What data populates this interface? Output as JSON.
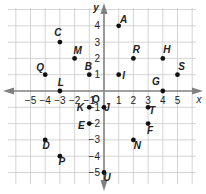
{
  "figure": {
    "title": "",
    "x_axis_label": "x",
    "y_axis_label": "y",
    "origin_label": "O",
    "x_ticks": [
      {
        "value": -5,
        "label": "−5"
      },
      {
        "value": -4,
        "label": "−4"
      },
      {
        "value": -3,
        "label": "−3"
      },
      {
        "value": -2,
        "label": "−2"
      },
      {
        "value": -1,
        "label": "−1"
      },
      {
        "value": 1,
        "label": "1"
      },
      {
        "value": 2,
        "label": "2"
      },
      {
        "value": 3,
        "label": "3"
      },
      {
        "value": 4,
        "label": "4"
      },
      {
        "value": 5,
        "label": "5"
      }
    ],
    "y_ticks": [
      {
        "value": 4,
        "label": "4"
      },
      {
        "value": 3,
        "label": "3"
      },
      {
        "value": 2,
        "label": "2"
      },
      {
        "value": 1,
        "label": "1"
      },
      {
        "value": -1,
        "label": "−1"
      },
      {
        "value": -2,
        "label": "−2"
      },
      {
        "value": -3,
        "label": "−3"
      },
      {
        "value": -4,
        "label": "−4"
      },
      {
        "value": -5,
        "label": "−5"
      }
    ],
    "points": [
      {
        "name": "A",
        "x": 1,
        "y": 4,
        "dx": 5,
        "dy": -3
      },
      {
        "name": "C",
        "x": -3,
        "y": 3,
        "dx": -2,
        "dy": -6
      },
      {
        "name": "M",
        "x": -2,
        "y": 2,
        "dx": 3,
        "dy": -4
      },
      {
        "name": "R",
        "x": 2,
        "y": 2,
        "dx": 3,
        "dy": -5
      },
      {
        "name": "H",
        "x": 4,
        "y": 2,
        "dx": 4,
        "dy": -5
      },
      {
        "name": "Q",
        "x": -4,
        "y": 1,
        "dx": -5,
        "dy": -4
      },
      {
        "name": "B",
        "x": -1,
        "y": 1,
        "dx": -1,
        "dy": -5
      },
      {
        "name": "I",
        "x": 1,
        "y": 1,
        "dx": 5,
        "dy": 4
      },
      {
        "name": "S",
        "x": 5,
        "y": 1,
        "dx": 4,
        "dy": -5
      },
      {
        "name": "L",
        "x": -3,
        "y": 0,
        "dx": 1,
        "dy": -5
      },
      {
        "name": "G",
        "x": 4,
        "y": 0,
        "dx": -7,
        "dy": -6
      },
      {
        "name": "K",
        "x": -1,
        "y": -1,
        "dx": -9,
        "dy": 4
      },
      {
        "name": "J",
        "x": 0,
        "y": -1,
        "dx": 3,
        "dy": 4
      },
      {
        "name": "T",
        "x": 3,
        "y": -1,
        "dx": 4,
        "dy": 7
      },
      {
        "name": "E",
        "x": -1,
        "y": -2,
        "dx": -8,
        "dy": 5
      },
      {
        "name": "F",
        "x": 3,
        "y": -2,
        "dx": 2,
        "dy": 10
      },
      {
        "name": "D",
        "x": -4,
        "y": -3,
        "dx": 1,
        "dy": 9
      },
      {
        "name": "N",
        "x": 2,
        "y": -3,
        "dx": 4,
        "dy": 9
      },
      {
        "name": "P",
        "x": -3,
        "y": -4,
        "dx": 2,
        "dy": 9
      },
      {
        "name": "U",
        "x": 0,
        "y": -5,
        "dx": 3,
        "dy": 8
      }
    ],
    "colors": {
      "grid": "#c9c9c9",
      "axis": "#808080",
      "point": "#111111",
      "text": "#222222"
    }
  }
}
